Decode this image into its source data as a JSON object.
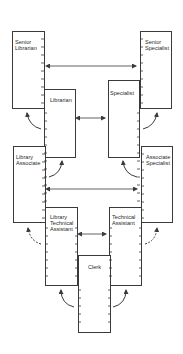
{
  "diagram": {
    "type": "career ladder",
    "line_color": "#3a3a3a",
    "tracks": {
      "library": {
        "positions": [
          {
            "id": "senior-librarian",
            "label": "Senior\nLibrarian",
            "level": 1
          },
          {
            "id": "librarian",
            "label": "Librarian",
            "level": 2
          },
          {
            "id": "library-associate",
            "label": "Library\nAssociate",
            "level": 3
          },
          {
            "id": "library-technical-assistant",
            "label": "Library\nTechnical\nAssistant",
            "level": 4
          }
        ]
      },
      "specialist": {
        "positions": [
          {
            "id": "senior-specialist",
            "label": "Senior\nSpecialist",
            "level": 1
          },
          {
            "id": "specialist",
            "label": "Specialist",
            "level": 2
          },
          {
            "id": "associate-specialist",
            "label": "Associate\nSpecialist",
            "level": 3
          },
          {
            "id": "technical-assistant",
            "label": "Technical\nAssistant",
            "level": 4
          }
        ]
      },
      "base": {
        "positions": [
          {
            "id": "clerk",
            "label": "Clerk",
            "level": 5
          }
        ]
      }
    },
    "boxes": {
      "senior_librarian": "Senior\nLibrarian",
      "senior_specialist": "Senior\nSpecialist",
      "librarian": "Librarian",
      "specialist": "Specialist",
      "library_associate": "Library\nAssociate",
      "associate_specialist": "Associate\nSpecialist",
      "library_technical_assistant": "Library\nTechnical\nAssistant",
      "technical_assistant": "Technical\nAssistant",
      "clerk": "Clerk"
    },
    "connections": [
      {
        "from": "senior-librarian",
        "to": "senior-specialist",
        "style": "solid",
        "kind": "lateral-double"
      },
      {
        "from": "librarian",
        "to": "specialist",
        "style": "solid",
        "kind": "lateral-double"
      },
      {
        "from": "library-associate",
        "to": "associate-specialist",
        "style": "solid",
        "kind": "lateral-double"
      },
      {
        "from": "library-technical-assistant",
        "to": "technical-assistant",
        "style": "solid",
        "kind": "lateral-double"
      },
      {
        "from": "librarian",
        "to": "senior-librarian",
        "style": "solid",
        "kind": "promotion"
      },
      {
        "from": "specialist",
        "to": "senior-specialist",
        "style": "solid",
        "kind": "promotion"
      },
      {
        "from": "library-associate",
        "to": "librarian",
        "style": "solid",
        "kind": "promotion"
      },
      {
        "from": "associate-specialist",
        "to": "specialist",
        "style": "solid",
        "kind": "promotion"
      },
      {
        "from": "library-technical-assistant",
        "to": "library-associate",
        "style": "dashed",
        "kind": "promotion"
      },
      {
        "from": "technical-assistant",
        "to": "associate-specialist",
        "style": "dashed",
        "kind": "promotion"
      },
      {
        "from": "clerk",
        "to": "library-technical-assistant",
        "style": "solid",
        "kind": "promotion"
      },
      {
        "from": "clerk",
        "to": "technical-assistant",
        "style": "solid",
        "kind": "promotion"
      }
    ]
  }
}
